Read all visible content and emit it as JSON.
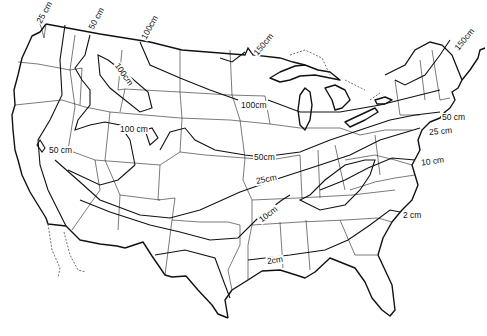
{
  "map": {
    "title": "",
    "region": "Contiguous United States",
    "style": "black-and-white line map with contour isolines",
    "colors": {
      "background": "#ffffff",
      "lines": "#111111"
    },
    "isolines": [
      {
        "id": "l25nw",
        "label": "25 cm",
        "x": 33,
        "y": 5,
        "rotate": -62
      },
      {
        "id": "l50nw",
        "label": "50 cm",
        "x": 86,
        "y": 10,
        "rotate": -62
      },
      {
        "id": "l100n",
        "label": "100cm",
        "x": 137,
        "y": 20,
        "rotate": -62
      },
      {
        "id": "l100rock",
        "label": "100cm",
        "x": 110,
        "y": 68,
        "rotate": 55
      },
      {
        "id": "l150n",
        "label": "150cm",
        "x": 250,
        "y": 38,
        "rotate": -50
      },
      {
        "id": "l150ne",
        "label": "150cm",
        "x": 452,
        "y": 33,
        "rotate": -50
      },
      {
        "id": "l100mid",
        "label": "100cm",
        "x": 240,
        "y": 101,
        "rotate": 0
      },
      {
        "id": "l100co",
        "label": "100 cm",
        "x": 120,
        "y": 126,
        "rotate": 0
      },
      {
        "id": "l50sw",
        "label": "50 cm",
        "x": 48,
        "y": 147,
        "rotate": 0
      },
      {
        "id": "l50mid",
        "label": "50cm",
        "x": 253,
        "y": 154,
        "rotate": 0
      },
      {
        "id": "l50ne",
        "label": "50 cm",
        "x": 440,
        "y": 113,
        "rotate": 0
      },
      {
        "id": "l25ne",
        "label": "25 cm",
        "x": 428,
        "y": 127,
        "rotate": -5
      },
      {
        "id": "l25mid",
        "label": "25cm",
        "x": 255,
        "y": 176,
        "rotate": -12
      },
      {
        "id": "l10ne",
        "label": "10 cm",
        "x": 420,
        "y": 158,
        "rotate": -8
      },
      {
        "id": "l10mid",
        "label": "10cm",
        "x": 258,
        "y": 210,
        "rotate": -38
      },
      {
        "id": "l2se",
        "label": "2 cm",
        "x": 402,
        "y": 212,
        "rotate": 0
      },
      {
        "id": "l2mid",
        "label": "2cm",
        "x": 266,
        "y": 258,
        "rotate": -8
      }
    ]
  }
}
